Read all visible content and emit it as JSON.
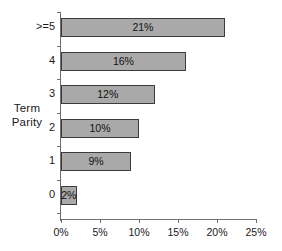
{
  "chart_data": {
    "type": "bar",
    "orientation": "horizontal",
    "title": "",
    "xlabel": "",
    "ylabel": "Term Parity",
    "ylabel_lines": [
      "Term",
      "Parity"
    ],
    "categories": [
      ">=5",
      "4",
      "3",
      "2",
      "1",
      "0"
    ],
    "values": [
      21,
      16,
      12,
      10,
      9,
      2
    ],
    "data_labels": [
      "21%",
      "16%",
      "12%",
      "10%",
      "9%",
      "2%"
    ],
    "xlim": [
      0,
      25
    ],
    "xticks": [
      0,
      5,
      10,
      15,
      20,
      25
    ],
    "xtick_labels": [
      "0%",
      "5%",
      "10%",
      "15%",
      "20%",
      "25%"
    ],
    "grid": false,
    "legend": "none",
    "bar_fill_color": "#a9a9a9",
    "bar_border_color": "#3c3c3c",
    "axis_color": "#6e6e6e",
    "background_color": "#ffffff"
  }
}
